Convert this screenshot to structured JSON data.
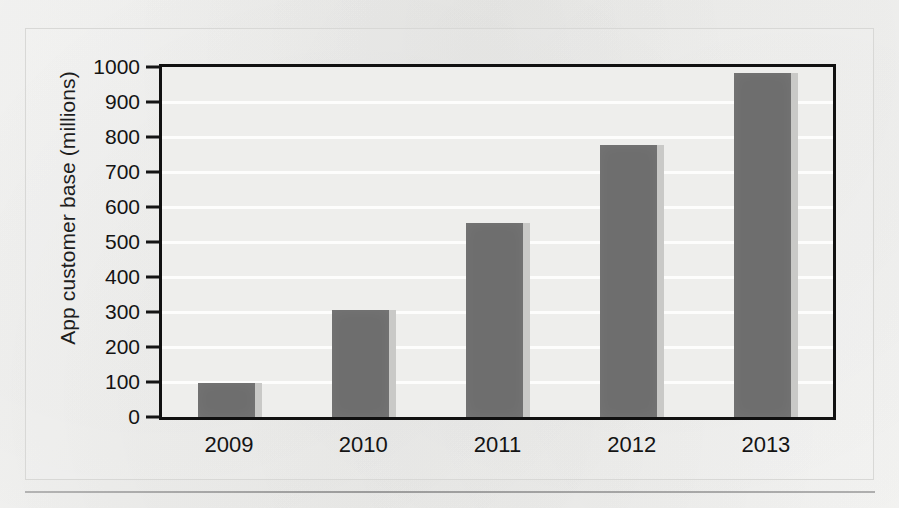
{
  "chart_data": {
    "type": "bar",
    "title": "",
    "xlabel": "",
    "ylabel": "App customer base (millions)",
    "categories": [
      "2009",
      "2010",
      "2011",
      "2012",
      "2013"
    ],
    "values": [
      98,
      307,
      555,
      777,
      983
    ],
    "series": [
      {
        "name": "App customer base",
        "values": [
          98,
          307,
          555,
          777,
          983
        ]
      }
    ],
    "ylim": [
      0,
      1000
    ],
    "ytick_labels": [
      "0",
      "100",
      "200",
      "300",
      "400",
      "500",
      "600",
      "700",
      "800",
      "900",
      "1000"
    ],
    "ytick_values": [
      0,
      100,
      200,
      300,
      400,
      500,
      600,
      700,
      800,
      900,
      1000
    ],
    "grid": "horizontal",
    "legend": "none",
    "bar_color": "#6e6e6e",
    "bar_edge_highlight_color": "#c9c9c7",
    "axis_color": "#111111",
    "gridline_color": "#fdfdfd",
    "plot_background_color": "#eeeeec",
    "page_background_color": "#f2f2f0"
  }
}
